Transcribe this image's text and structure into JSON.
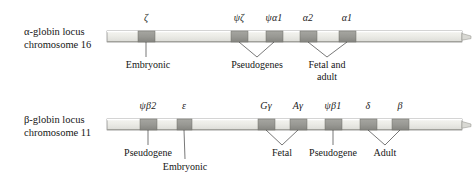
{
  "figure": {
    "background": "#ffffff",
    "colors": {
      "chromosome_fill": "#e8e8e4",
      "chromosome_top_band": "#f2f2ee",
      "chromosome_bottom_band": "#d4d4cf",
      "gene_block": "#9a9a95",
      "gene_block_dark": "#8d8d88",
      "outline": "#707070",
      "leader_line": "#3d3d3d",
      "text": "#161616"
    }
  },
  "loci": [
    {
      "id": "alpha",
      "label_line1": "α-globin locus",
      "label_line2": "chromosome 16",
      "label_x": 24,
      "label_y": 28,
      "bar": {
        "x": 107,
        "y": 31,
        "width": 355,
        "height": 11
      },
      "genes": [
        {
          "name": "ζ",
          "x": 138,
          "width": 17,
          "label": "ζ",
          "label_x": 146,
          "label_y": 12
        },
        {
          "name": "psi-zeta",
          "x": 231,
          "width": 17,
          "label": "ψζ",
          "label_x": 239,
          "label_y": 12
        },
        {
          "name": "psi-alpha-1",
          "x": 266,
          "width": 17,
          "label": "ψα1",
          "label_x": 274,
          "label_y": 12
        },
        {
          "name": "alpha-2",
          "x": 300,
          "width": 17,
          "label": "α2",
          "label_x": 308,
          "label_y": 12
        },
        {
          "name": "alpha-1",
          "x": 339,
          "width": 17,
          "label": "α1",
          "label_x": 347,
          "label_y": 12
        }
      ],
      "annotations": [
        {
          "id": "embryonic",
          "text": "Embryonic",
          "text_x": 148,
          "text_y": 62,
          "apex_x": 146,
          "apex_y": 57,
          "targets": [
            146
          ]
        },
        {
          "id": "pseudogenes",
          "text": "Pseudogenes",
          "text_x": 257,
          "text_y": 62,
          "apex_x": 257,
          "apex_y": 57,
          "targets": [
            239,
            274
          ]
        },
        {
          "id": "fetal-and-adult",
          "text": "Fetal and",
          "text_line2": "adult",
          "text_x": 327,
          "text_y": 62,
          "apex_x": 327,
          "apex_y": 57,
          "targets": [
            308,
            347
          ]
        }
      ]
    },
    {
      "id": "beta",
      "label_line1": "β-globin locus",
      "label_line2": "chromosome 11",
      "label_x": 24,
      "label_y": 116,
      "bar": {
        "x": 107,
        "y": 119,
        "width": 355,
        "height": 11
      },
      "genes": [
        {
          "name": "psi-beta-2",
          "x": 140,
          "width": 17,
          "label": "ψβ2",
          "label_x": 148,
          "label_y": 100
        },
        {
          "name": "epsilon",
          "x": 177,
          "width": 15,
          "label": "ε",
          "label_x": 184,
          "label_y": 100
        },
        {
          "name": "g-gamma",
          "x": 258,
          "width": 17,
          "label": "Gγ",
          "label_x": 266,
          "label_y": 100
        },
        {
          "name": "a-gamma",
          "x": 290,
          "width": 17,
          "label": "Aγ",
          "label_x": 298,
          "label_y": 100
        },
        {
          "name": "psi-beta-1",
          "x": 325,
          "width": 17,
          "label": "ψβ1",
          "label_x": 333,
          "label_y": 100
        },
        {
          "name": "delta",
          "x": 360,
          "width": 17,
          "label": "δ",
          "label_x": 368,
          "label_y": 100
        },
        {
          "name": "beta",
          "x": 392,
          "width": 17,
          "label": "β",
          "label_x": 400,
          "label_y": 100
        }
      ],
      "annotations": [
        {
          "id": "pseudogene-left",
          "text": "Pseudogene",
          "text_x": 148,
          "text_y": 150,
          "apex_x": 148,
          "apex_y": 145,
          "targets": [
            148
          ]
        },
        {
          "id": "embryonic",
          "text": "Embryonic",
          "text_x": 185,
          "text_y": 164,
          "apex_x": 185,
          "apex_y": 159,
          "targets": [
            184
          ]
        },
        {
          "id": "fetal",
          "text": "Fetal",
          "text_x": 282,
          "text_y": 150,
          "apex_x": 282,
          "apex_y": 145,
          "targets": [
            266,
            298
          ]
        },
        {
          "id": "pseudogene-right",
          "text": "Pseudogene",
          "text_x": 333,
          "text_y": 150,
          "apex_x": 333,
          "apex_y": 145,
          "targets": [
            333
          ]
        },
        {
          "id": "adult",
          "text": "Adult",
          "text_x": 385,
          "text_y": 150,
          "apex_x": 385,
          "apex_y": 145,
          "targets": [
            368,
            400
          ]
        }
      ]
    }
  ]
}
